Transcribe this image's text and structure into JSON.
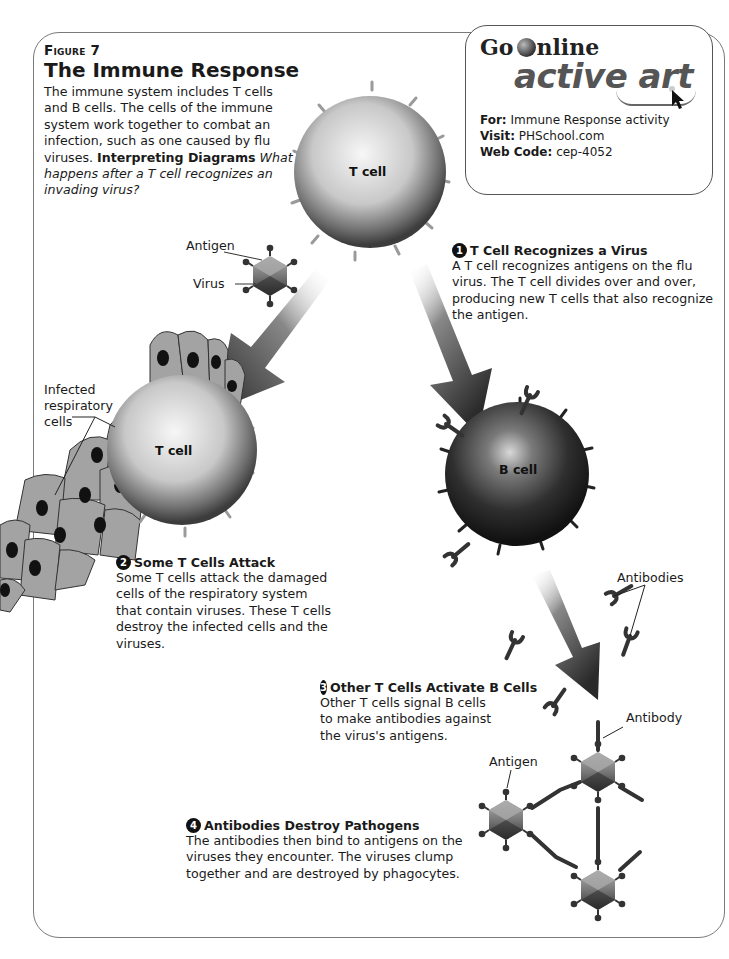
{
  "figure": {
    "label": "Figure 7",
    "title": "The Immune Response",
    "intro": "The immune system includes T cells and B cells. The cells of the immune system work together to combat an infection, such as one caused by flu viruses.",
    "interpreting_label": "Interpreting Diagrams",
    "interpreting_question": "What happens after a T cell recognizes an invading virus?"
  },
  "go_online": {
    "brand_text": "Go Online",
    "brand_go": "Go",
    "brand_online": "nline",
    "subtitle": "active art",
    "for_label": "For:",
    "for_value": "Immune Response activity",
    "visit_label": "Visit:",
    "visit_value": "PHSchool.com",
    "webcode_label": "Web Code:",
    "webcode_value": "cep-4052"
  },
  "cells": {
    "tcell_top": "T cell",
    "tcell_attack": "T cell",
    "bcell": "B cell"
  },
  "labels": {
    "antigen_top": "Antigen",
    "virus": "Virus",
    "infected_cells": [
      "Infected",
      "respiratory",
      "cells"
    ],
    "antibodies": "Antibodies",
    "antibody": "Antibody",
    "antigen_bottom": "Antigen"
  },
  "steps": [
    {
      "number": "1",
      "title": "T Cell Recognizes a Virus",
      "body": "A T cell recognizes antigens on the flu virus. The T cell divides over and over, producing new T cells that also recognize the antigen."
    },
    {
      "number": "2",
      "title": "Some T Cells Attack",
      "body": "Some T cells attack the damaged cells of the respiratory system that contain viruses. These T cells destroy the infected cells and the viruses."
    },
    {
      "number": "3",
      "title": "Other T Cells Activate B Cells",
      "body": "Other T cells signal B cells to make antibodies against the virus's antigens."
    },
    {
      "number": "4",
      "title": "Antibodies Destroy Pathogens",
      "body": "The antibodies then bind to antigens on the viruses they encounter. The viruses clump together and are destroyed by phagocytes."
    }
  ],
  "colors": {
    "frame": "#7a7a7a",
    "tcell_light": "#f2f2f2",
    "tcell_dark": "#5a5a5a",
    "bcell_dark": "#1c1c1c",
    "arrow": "#3a3a3a",
    "resp_cell": "#9a9a9a",
    "nucleus": "#111111"
  }
}
